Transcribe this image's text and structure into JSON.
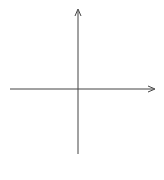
{
  "graph": {
    "x_axis_label": "x",
    "y_axis_label": "y",
    "x_range": [
      -6,
      6
    ],
    "y_range": [
      -6,
      6
    ],
    "x_ticks": [
      {
        "value": -5,
        "label": "−5"
      },
      {
        "value": -4,
        "label": "−4"
      },
      {
        "value": -3,
        "label": "−3"
      },
      {
        "value": -2,
        "label": "−2"
      },
      {
        "value": -1,
        "label": "−1"
      },
      {
        "value": 1,
        "label": "1"
      },
      {
        "value": 2,
        "label": "2"
      },
      {
        "value": 3,
        "label": "3"
      },
      {
        "value": 4,
        "label": "4"
      },
      {
        "value": 5,
        "label": "5"
      }
    ],
    "y_ticks": [
      {
        "value": 5,
        "label": "5"
      },
      {
        "value": 4,
        "label": "4"
      },
      {
        "value": 3,
        "label": "3"
      },
      {
        "value": 2,
        "label": "2"
      },
      {
        "value": 1,
        "label": "1"
      },
      {
        "value": -1,
        "label": "1"
      },
      {
        "value": -2,
        "label": "−2"
      },
      {
        "value": -3,
        "label": "−3"
      },
      {
        "value": -4,
        "label": "−4"
      },
      {
        "value": -5,
        "label": "−5"
      }
    ],
    "colors": {
      "grid": "#d9d9d9",
      "axis": "#444444",
      "text": "#333333"
    }
  }
}
